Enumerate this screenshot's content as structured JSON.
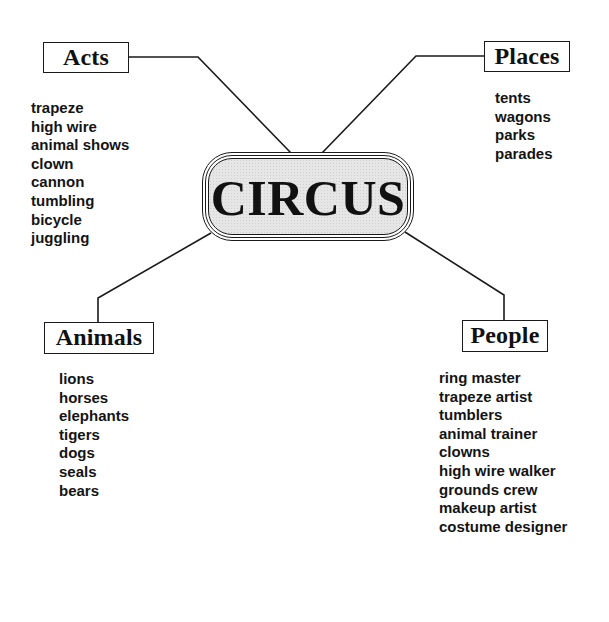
{
  "diagram": {
    "type": "concept-map",
    "center": {
      "label": "CIRCUS"
    },
    "branches": [
      {
        "id": "acts",
        "label": "Acts",
        "items": [
          "trapeze",
          "high wire",
          "animal shows",
          "clown",
          "cannon",
          "tumbling",
          "bicycle",
          "juggling"
        ]
      },
      {
        "id": "places",
        "label": "Places",
        "items": [
          "tents",
          "wagons",
          "parks",
          "parades"
        ]
      },
      {
        "id": "animals",
        "label": "Animals",
        "items": [
          "lions",
          "horses",
          "elephants",
          "tigers",
          "dogs",
          "seals",
          "bears"
        ]
      },
      {
        "id": "people",
        "label": "People",
        "items": [
          "ring master",
          "trapeze artist",
          "tumblers",
          "animal trainer",
          "clowns",
          "high wire walker",
          "grounds crew",
          "makeup artist",
          "costume designer"
        ]
      }
    ]
  },
  "colors": {
    "line": "#1a1a1a",
    "text": "#111111",
    "center_fill": "#e6e6e6",
    "background": "#ffffff"
  }
}
